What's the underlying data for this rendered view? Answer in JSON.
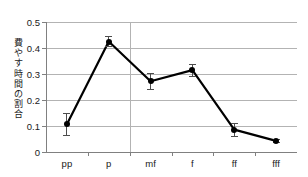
{
  "chart_data": {
    "type": "line",
    "title": "",
    "subtitle": "",
    "xlabel": "",
    "ylabel": "費やす時間の割合",
    "categories": [
      "pp",
      "p",
      "mf",
      "f",
      "ff",
      "fff"
    ],
    "values": [
      0.107,
      0.425,
      0.272,
      0.315,
      0.086,
      0.043
    ],
    "error_upper": [
      0.042,
      0.02,
      0.031,
      0.023,
      0.024,
      0.006
    ],
    "error_lower": [
      0.04,
      0.018,
      0.03,
      0.022,
      0.024,
      0.006
    ],
    "ylim": [
      0,
      0.5
    ],
    "ytick_labels": [
      "0",
      "0.1",
      "0.2",
      "0.3",
      "0.4",
      "0.5"
    ],
    "ytick_values": [
      0,
      0.1,
      0.2,
      0.3,
      0.4,
      0.5
    ],
    "xtick_labels": [
      "pp",
      "p",
      "mf",
      "f",
      "ff",
      "fff"
    ],
    "grid": "horizontal",
    "legend": "none",
    "series": [
      {
        "name": "費やす時間の割合",
        "values": [
          0.107,
          0.425,
          0.272,
          0.315,
          0.086,
          0.043
        ]
      }
    ],
    "colors": {
      "line": "#000000",
      "marker": "#000000",
      "grid": "#b3b3b3",
      "axis": "#808080",
      "text": "#1a1a1a",
      "background": "#ffffff"
    }
  }
}
